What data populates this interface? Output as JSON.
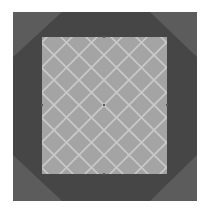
{
  "diagram": {
    "type": "nested-shapes",
    "colors": {
      "background": "#ffffff",
      "outer_square": "#5c5c5c",
      "octagon": "#464646",
      "inner_square": "#a4a4a4",
      "grid_line": "#c9c9c9",
      "marker": "#5a5a5a"
    },
    "outer_square": {
      "x": 13,
      "y": 12,
      "width": 184,
      "height": 189
    },
    "octagon": {
      "points": [
        [
          62,
          12
        ],
        [
          150,
          12
        ],
        [
          197,
          57
        ],
        [
          197,
          155
        ],
        [
          150,
          201
        ],
        [
          62,
          201
        ],
        [
          13,
          155
        ],
        [
          13,
          57
        ]
      ]
    },
    "inner_square": {
      "x": 42,
      "y": 37,
      "width": 125,
      "height": 137
    },
    "grid": {
      "orientation": "diagonal-45deg",
      "period": 25,
      "line_width": 1.6,
      "origin": [
        104,
        105
      ]
    },
    "markers": [
      {
        "name": "center",
        "x": 104,
        "y": 105
      },
      {
        "name": "top-mid",
        "x": 104,
        "y": 37
      },
      {
        "name": "bottom-mid",
        "x": 104,
        "y": 174
      },
      {
        "name": "left-mid",
        "x": 42,
        "y": 105
      },
      {
        "name": "right-mid",
        "x": 167,
        "y": 105
      }
    ]
  }
}
